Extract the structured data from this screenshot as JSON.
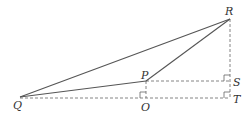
{
  "diagram": {
    "type": "geometry",
    "colors": {
      "solid": "#555555",
      "dashed": "#666666",
      "label": "#333333",
      "background": "#ffffff"
    },
    "points": {
      "Q": {
        "label": "Q",
        "x": 20,
        "y": 97
      },
      "R": {
        "label": "R",
        "x": 230,
        "y": 19
      },
      "P": {
        "label": "P",
        "x": 146,
        "y": 81
      },
      "O": {
        "label": "O",
        "x": 146,
        "y": 98
      },
      "S": {
        "label": "S",
        "x": 230,
        "y": 81
      },
      "T": {
        "label": "T",
        "x": 230,
        "y": 98
      }
    },
    "solid_segments": [
      "QR",
      "QP",
      "PR"
    ],
    "dashed_segments": [
      "QT",
      "PS",
      "RT",
      "PO"
    ],
    "right_angles": [
      "O",
      "S",
      "T"
    ]
  }
}
